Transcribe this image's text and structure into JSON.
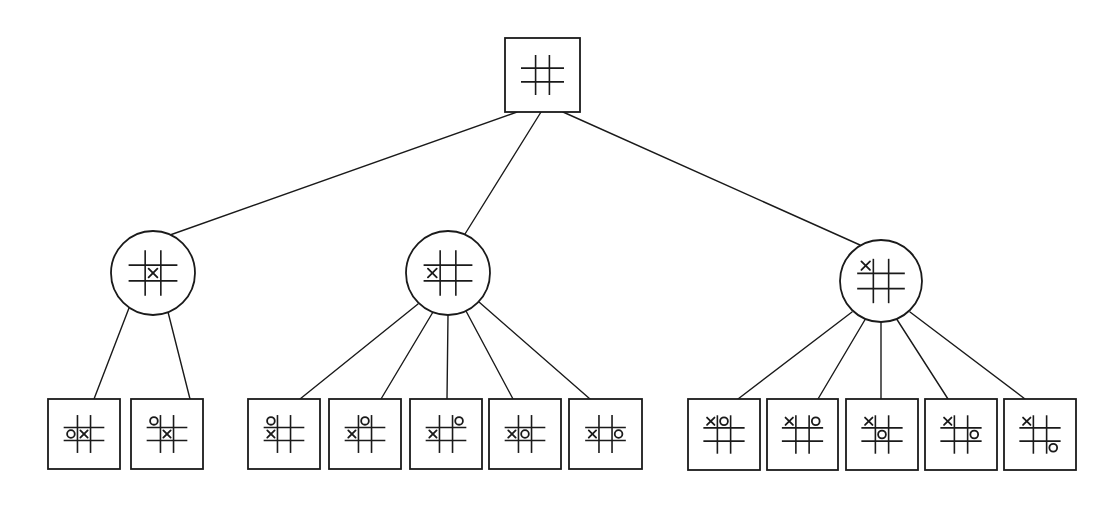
{
  "diagram": {
    "title": "",
    "type": "tic-tac-toe game tree",
    "colors": {
      "ink": "#1a1a1a",
      "background": "#ffffff"
    },
    "board_encoding": "9 cells row-major: index 0-2 top row, 3-5 middle row, 6-8 bottom row; values 'X', 'O' or ''",
    "nodes": [
      {
        "id": "root",
        "level": 0,
        "shape": "square",
        "x": 505,
        "y": 38,
        "w": 75,
        "h": 74,
        "board": [
          "",
          "",
          "",
          "",
          "",
          "",
          "",
          "",
          ""
        ]
      },
      {
        "id": "a",
        "level": 1,
        "shape": "circle",
        "cx": 153,
        "cy": 273,
        "r": 42,
        "board": [
          "",
          "",
          "",
          "",
          "X",
          "",
          "",
          "",
          ""
        ]
      },
      {
        "id": "b",
        "level": 1,
        "shape": "circle",
        "cx": 448,
        "cy": 273,
        "r": 42,
        "board": [
          "",
          "",
          "",
          "X",
          "",
          "",
          "",
          "",
          ""
        ]
      },
      {
        "id": "c",
        "level": 1,
        "shape": "circle",
        "cx": 881,
        "cy": 281,
        "r": 41,
        "board": [
          "X",
          "",
          "",
          "",
          "",
          "",
          "",
          "",
          ""
        ]
      },
      {
        "id": "a1",
        "level": 2,
        "shape": "square",
        "x": 48,
        "y": 399,
        "w": 72,
        "h": 70,
        "board": [
          "",
          "",
          "",
          "O",
          "X",
          "",
          "",
          "",
          ""
        ]
      },
      {
        "id": "a2",
        "level": 2,
        "shape": "square",
        "x": 131,
        "y": 399,
        "w": 72,
        "h": 70,
        "board": [
          "O",
          "",
          "",
          "",
          "X",
          "",
          "",
          "",
          ""
        ]
      },
      {
        "id": "b1",
        "level": 2,
        "shape": "square",
        "x": 248,
        "y": 399,
        "w": 72,
        "h": 70,
        "board": [
          "O",
          "",
          "",
          "X",
          "",
          "",
          "",
          "",
          ""
        ]
      },
      {
        "id": "b2",
        "level": 2,
        "shape": "square",
        "x": 329,
        "y": 399,
        "w": 72,
        "h": 70,
        "board": [
          "",
          "O",
          "",
          "X",
          "",
          "",
          "",
          "",
          ""
        ]
      },
      {
        "id": "b3",
        "level": 2,
        "shape": "square",
        "x": 410,
        "y": 399,
        "w": 72,
        "h": 70,
        "board": [
          "",
          "",
          "O",
          "X",
          "",
          "",
          "",
          "",
          ""
        ]
      },
      {
        "id": "b4",
        "level": 2,
        "shape": "square",
        "x": 489,
        "y": 399,
        "w": 72,
        "h": 70,
        "board": [
          "",
          "",
          "",
          "X",
          "O",
          "",
          "",
          "",
          ""
        ]
      },
      {
        "id": "b5",
        "level": 2,
        "shape": "square",
        "x": 569,
        "y": 399,
        "w": 73,
        "h": 70,
        "board": [
          "",
          "",
          "",
          "X",
          "",
          "O",
          "",
          "",
          ""
        ]
      },
      {
        "id": "c1",
        "level": 2,
        "shape": "square",
        "x": 688,
        "y": 399,
        "w": 72,
        "h": 71,
        "board": [
          "X",
          "O",
          "",
          "",
          "",
          "",
          "",
          "",
          ""
        ]
      },
      {
        "id": "c2",
        "level": 2,
        "shape": "square",
        "x": 767,
        "y": 399,
        "w": 71,
        "h": 71,
        "board": [
          "X",
          "",
          "O",
          "",
          "",
          "",
          "",
          "",
          ""
        ]
      },
      {
        "id": "c3",
        "level": 2,
        "shape": "square",
        "x": 846,
        "y": 399,
        "w": 72,
        "h": 71,
        "board": [
          "X",
          "",
          "",
          "",
          "O",
          "",
          "",
          "",
          ""
        ]
      },
      {
        "id": "c4",
        "level": 2,
        "shape": "square",
        "x": 925,
        "y": 399,
        "w": 72,
        "h": 71,
        "board": [
          "X",
          "",
          "",
          "",
          "",
          "O",
          "",
          "",
          ""
        ]
      },
      {
        "id": "c5",
        "level": 2,
        "shape": "square",
        "x": 1004,
        "y": 399,
        "w": 72,
        "h": 71,
        "board": [
          "X",
          "",
          "",
          "",
          "",
          "",
          "",
          "",
          "O"
        ]
      }
    ],
    "edges": [
      {
        "from": "root",
        "to": "a",
        "x1": 517,
        "y1": 112,
        "x2": 170,
        "y2": 235
      },
      {
        "from": "root",
        "to": "b",
        "x1": 541,
        "y1": 112,
        "x2": 465,
        "y2": 234
      },
      {
        "from": "root",
        "to": "c",
        "x1": 563,
        "y1": 112,
        "x2": 860,
        "y2": 245
      },
      {
        "from": "a",
        "to": "a1",
        "x1": 129,
        "y1": 308,
        "x2": 94,
        "y2": 399
      },
      {
        "from": "a",
        "to": "a2",
        "x1": 168,
        "y1": 312,
        "x2": 190,
        "y2": 399
      },
      {
        "from": "b",
        "to": "b1",
        "x1": 418,
        "y1": 304,
        "x2": 300,
        "y2": 399
      },
      {
        "from": "b",
        "to": "b2",
        "x1": 433,
        "y1": 312,
        "x2": 381,
        "y2": 399
      },
      {
        "from": "b",
        "to": "b3",
        "x1": 448,
        "y1": 315,
        "x2": 447,
        "y2": 399
      },
      {
        "from": "b",
        "to": "b4",
        "x1": 466,
        "y1": 311,
        "x2": 513,
        "y2": 399
      },
      {
        "from": "b",
        "to": "b5",
        "x1": 479,
        "y1": 302,
        "x2": 590,
        "y2": 399
      },
      {
        "from": "c",
        "to": "c1",
        "x1": 852,
        "y1": 312,
        "x2": 738,
        "y2": 399
      },
      {
        "from": "c",
        "to": "c2",
        "x1": 866,
        "y1": 318,
        "x2": 818,
        "y2": 399
      },
      {
        "from": "c",
        "to": "c3",
        "x1": 881,
        "y1": 322,
        "x2": 881,
        "y2": 399
      },
      {
        "from": "c",
        "to": "c4",
        "x1": 896,
        "y1": 318,
        "x2": 948,
        "y2": 399
      },
      {
        "from": "c",
        "to": "c5",
        "x1": 910,
        "y1": 312,
        "x2": 1025,
        "y2": 399
      }
    ]
  }
}
